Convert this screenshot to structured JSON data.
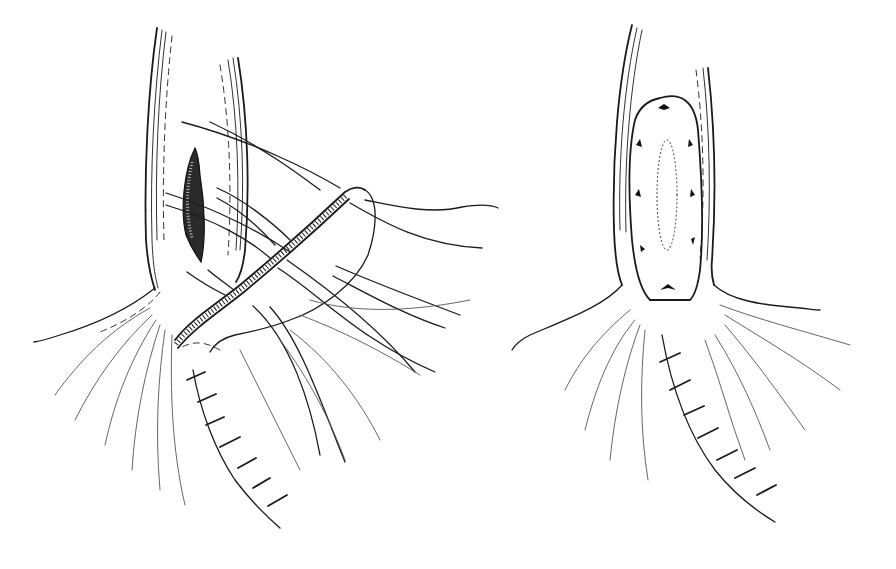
{
  "figure": {
    "background": "#ffffff",
    "ink_color": "#1a1a1a",
    "panels": [
      {
        "id": "left",
        "label": "",
        "depicts": "Vessel/duct with longitudinal incision (stippled), patch with hatched edge and multiple stay sutures being placed; running sutured incision below"
      },
      {
        "id": "right",
        "label": "",
        "depicts": "Completed oval patch closure with interrupted sutures around the rim; sutured incision below"
      }
    ]
  }
}
